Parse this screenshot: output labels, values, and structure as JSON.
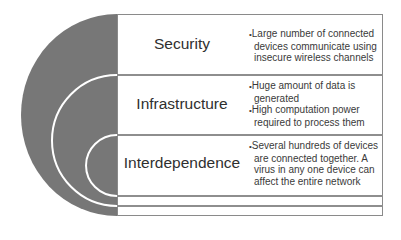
{
  "diagram": {
    "type": "layered-arc-list",
    "colors": {
      "arc_fill": "#777777",
      "arc_lines": "#ffffff",
      "frame_border": "#8a8a8a",
      "text": "#2f2f2f"
    },
    "items": [
      {
        "title": "Security",
        "bullets": [
          "Large number of connected devices communicate using insecure wireless channels"
        ]
      },
      {
        "title": "Infrastructure",
        "bullets": [
          "Huge amount of data is generated",
          "High computation power required to process them"
        ]
      },
      {
        "title": "Interdependence",
        "bullets": [
          "Several hundreds of devices are connected together. A virus in any one device can affect the entire network"
        ]
      }
    ]
  }
}
